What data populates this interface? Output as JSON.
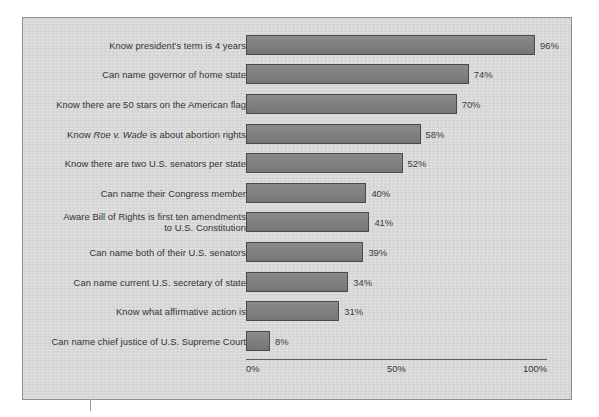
{
  "chart_data": {
    "type": "bar",
    "orientation": "horizontal",
    "title": "",
    "subtitle": "",
    "xlabel": "",
    "ylabel": "",
    "xlim": [
      0,
      100
    ],
    "grid": false,
    "legend": null,
    "xticks": [
      "0%",
      "50%",
      "100%"
    ],
    "xtick_values": [
      0,
      50,
      100
    ],
    "value_suffix": "%",
    "categories": [
      "Know president's term is 4 years",
      "Can name governor of home state",
      "Know there are 50 stars on the American flag",
      "Know Roe v. Wade is about abortion rights",
      "Know there are two U.S. senators per state",
      "Can name their Congress member",
      "Aware Bill of Rights is first ten amendments to U.S. Constitution",
      "Can name both of their U.S. senators",
      "Can name current U.S. secretary of state",
      "Know what affirmative action is",
      "Can name chief justice of U.S. Supreme Court"
    ],
    "values": [
      96,
      74,
      70,
      58,
      52,
      40,
      41,
      39,
      34,
      31,
      8
    ],
    "value_labels": [
      "96%",
      "74%",
      "70%",
      "58%",
      "52%",
      "40%",
      "41%",
      "39%",
      "34%",
      "31%",
      "8%"
    ],
    "bars": [
      {
        "label_line1": "Know president's term is 4 years",
        "label_line2": "",
        "italic_part": "",
        "value": 96,
        "value_label": "96%"
      },
      {
        "label_line1": "Can name governor of home state",
        "label_line2": "",
        "italic_part": "",
        "value": 74,
        "value_label": "74%"
      },
      {
        "label_line1": "Know there are 50 stars on the American flag",
        "label_line2": "",
        "italic_part": "",
        "value": 70,
        "value_label": "70%"
      },
      {
        "label_line1": "Know ",
        "label_line2": "",
        "italic_part": "Roe v. Wade",
        "label_tail": " is about abortion rights",
        "value": 58,
        "value_label": "58%"
      },
      {
        "label_line1": "Know there are two U.S. senators per state",
        "label_line2": "",
        "italic_part": "",
        "value": 52,
        "value_label": "52%"
      },
      {
        "label_line1": "Can name their Congress member",
        "label_line2": "",
        "italic_part": "",
        "value": 40,
        "value_label": "40%"
      },
      {
        "label_line1": "Aware Bill of Rights is first ten amendments",
        "label_line2": "to U.S. Constitution",
        "italic_part": "",
        "value": 41,
        "value_label": "41%"
      },
      {
        "label_line1": "Can name both of their U.S. senators",
        "label_line2": "",
        "italic_part": "",
        "value": 39,
        "value_label": "39%"
      },
      {
        "label_line1": "Can name current U.S. secretary of state",
        "label_line2": "",
        "italic_part": "",
        "value": 34,
        "value_label": "34%"
      },
      {
        "label_line1": "Know what affirmative action is",
        "label_line2": "",
        "italic_part": "",
        "value": 31,
        "value_label": "31%"
      },
      {
        "label_line1": "Can name chief justice of U.S. Supreme Court",
        "label_line2": "",
        "italic_part": "",
        "value": 8,
        "value_label": "8%"
      }
    ],
    "colors": {
      "bar_fill": "#7d7d7d",
      "bar_stroke": "#4a4a4a",
      "panel_background": "#d9d9d9",
      "panel_border": "#8f8f8f",
      "text": "#333333",
      "axis_line": "#5a5a5a",
      "page_background": "#ffffff"
    }
  }
}
